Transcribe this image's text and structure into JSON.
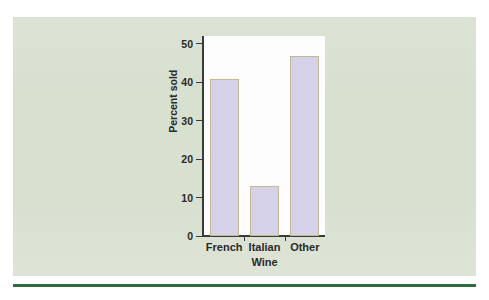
{
  "figure": {
    "panel_color": "#d8e0d0",
    "page_color": "#ffffff",
    "rule_color": "#2f6b3c"
  },
  "chart_data": {
    "type": "bar",
    "title": "",
    "subtitle": "",
    "xlabel": "Wine",
    "ylabel": "Percent sold",
    "categories": [
      "French",
      "Italian",
      "Other"
    ],
    "values": [
      40.8,
      13.0,
      46.7
    ],
    "ylim": [
      0,
      52
    ],
    "yticks": [
      0,
      10,
      20,
      30,
      40,
      50
    ],
    "ytick_labels": [
      "0",
      "10",
      "20",
      "30",
      "40",
      "50"
    ],
    "grid": false,
    "legend": null,
    "legend_position": "none",
    "bar_fill_color": "#d5d1e8",
    "bar_edge_color": "#c2b891",
    "plot_background": "#fdfdfd",
    "axis_color": "#3a3a38"
  }
}
